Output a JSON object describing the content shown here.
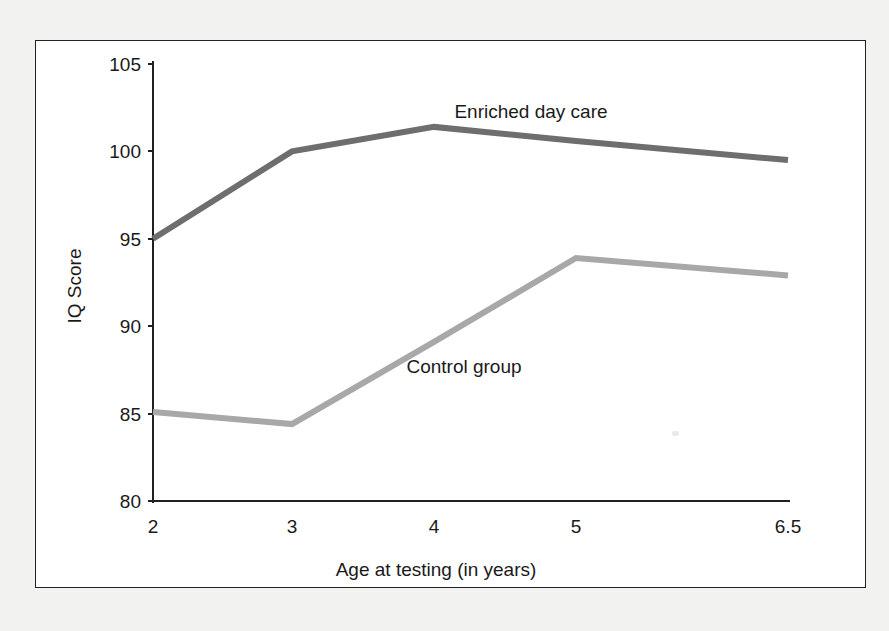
{
  "chart_data": {
    "type": "line",
    "title": "",
    "xlabel": "Age at testing (in years)",
    "ylabel": "IQ Score",
    "categories": [
      "2",
      "3",
      "4",
      "5",
      "6.5"
    ],
    "x_tick_labels": [
      "2",
      "3",
      "4",
      "5",
      "6.5"
    ],
    "y_tick_labels": [
      "80",
      "85",
      "90",
      "95",
      "100",
      "105"
    ],
    "y_ticks": [
      80,
      85,
      90,
      95,
      100,
      105
    ],
    "ylim": [
      80,
      105
    ],
    "grid": false,
    "legend_position": "inline-labels",
    "series": [
      {
        "name": "Enriched day care",
        "color": "#6e6e6e",
        "values": [
          95.0,
          100.0,
          101.4,
          100.6,
          99.5
        ],
        "label_text": "Enriched day care"
      },
      {
        "name": "Control group",
        "color": "#a8a8a8",
        "values": [
          85.1,
          84.4,
          89.1,
          93.9,
          92.9
        ],
        "label_text": "Control group"
      }
    ],
    "annotations": [
      {
        "text": "Enriched day care",
        "x": "4",
        "y": 103.5
      },
      {
        "text": "Control group",
        "x": "3.8",
        "y": 87.0
      }
    ]
  },
  "axes": {
    "y_title": "IQ Score",
    "x_title": "Age at testing (in years)"
  },
  "colors": {
    "frame": "#23211f",
    "axis": "#23211f",
    "enriched": "#6e6e6e",
    "control": "#a8a8a8",
    "page_background": "#f2f2f0",
    "plot_background": "#ffffff"
  }
}
